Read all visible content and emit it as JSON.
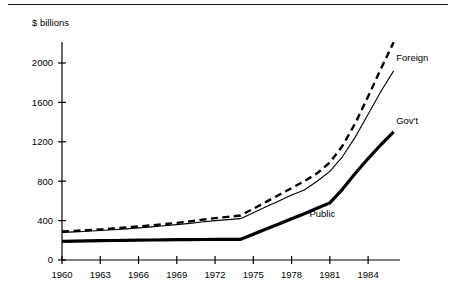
{
  "chart_data": {
    "type": "line",
    "title": "",
    "subtitle": "",
    "xlabel": "",
    "ylabel": "$ billions",
    "y_axis_caption": "$ billions",
    "x": [
      1960,
      1961,
      1962,
      1963,
      1964,
      1965,
      1966,
      1967,
      1968,
      1969,
      1970,
      1971,
      1972,
      1973,
      1974,
      1975,
      1976,
      1977,
      1978,
      1979,
      1980,
      1981,
      1982,
      1983,
      1984,
      1985,
      1986
    ],
    "xlim": [
      1960,
      1986.5
    ],
    "ylim": [
      0,
      2250
    ],
    "xticks": [
      1960,
      1963,
      1966,
      1969,
      1972,
      1975,
      1978,
      1981,
      1984
    ],
    "xticklabels": [
      "1960",
      "1963",
      "1966",
      "1969",
      "1972",
      "1975",
      "1978",
      "1981",
      "1984"
    ],
    "yticks": [
      0,
      400,
      800,
      1200,
      1600,
      2000
    ],
    "yticklabels": [
      "0",
      "400",
      "800",
      "1200",
      "1600",
      "2000"
    ],
    "grid": false,
    "legend_position": "inline-right",
    "series": [
      {
        "name": "Foreign",
        "label": "Foreign",
        "style": "dashed",
        "color": "#000000",
        "values": [
          290,
          296,
          303,
          311,
          320,
          330,
          341,
          352,
          364,
          377,
          392,
          408,
          425,
          438,
          452,
          520,
          590,
          660,
          730,
          800,
          880,
          990,
          1160,
          1390,
          1660,
          1940,
          2210
        ]
      },
      {
        "name": "Gov't",
        "label": "Gov't",
        "style": "solid-thin",
        "color": "#000000",
        "values": [
          280,
          286,
          292,
          299,
          307,
          316,
          326,
          336,
          347,
          359,
          372,
          386,
          400,
          410,
          420,
          480,
          540,
          600,
          660,
          710,
          800,
          900,
          1050,
          1250,
          1480,
          1710,
          1920
        ]
      },
      {
        "name": "Public",
        "label": "Public",
        "style": "solid-thick",
        "color": "#000000",
        "values": [
          190,
          192,
          194,
          196,
          198,
          200,
          202,
          203,
          205,
          206,
          207,
          208,
          209,
          210,
          210,
          262,
          314,
          366,
          418,
          470,
          525,
          580,
          720,
          880,
          1030,
          1170,
          1300
        ]
      }
    ],
    "annotations": [
      {
        "text": "Foreign",
        "x": 1986.2,
        "y": 2020,
        "anchor": "start"
      },
      {
        "text": "Gov't",
        "x": 1986.2,
        "y": 1380,
        "anchor": "start"
      },
      {
        "text": "Public",
        "x": 1979.4,
        "y": 440,
        "anchor": "start"
      }
    ]
  }
}
